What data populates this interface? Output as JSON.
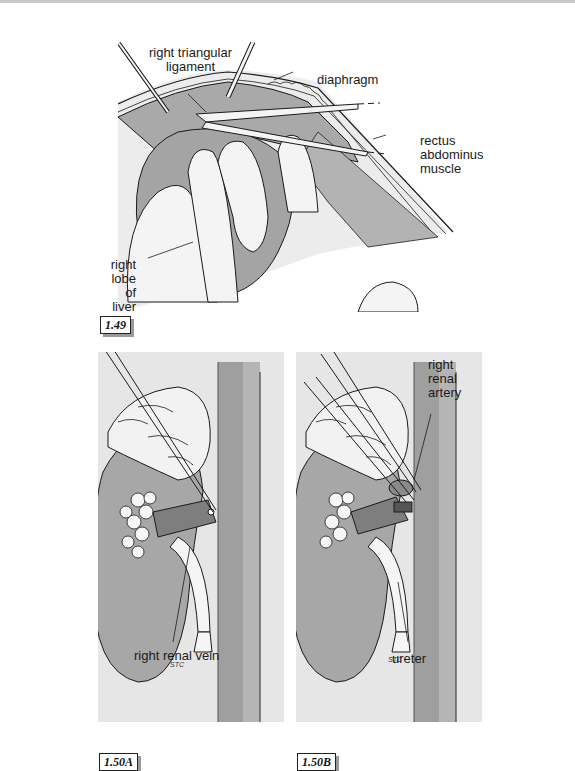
{
  "figures": [
    {
      "id": "fig-1-49",
      "tag": "1.49",
      "labels": {
        "right_triangular_ligament": [
          "right triangular",
          "ligament"
        ],
        "diaphragm": "diaphragm",
        "rectus_abdominus_muscle": [
          "rectus",
          "abdominus",
          "muscle"
        ],
        "right_lobe_of_liver": [
          "right",
          "lobe",
          "of",
          "liver"
        ],
        "signature": "STC"
      }
    },
    {
      "id": "fig-1-50a",
      "tag": "1.50A",
      "labels": {
        "right_renal_vein": "right renal vein",
        "signature": "STC"
      }
    },
    {
      "id": "fig-1-50b",
      "tag": "1.50B",
      "labels": {
        "right_renal_artery": [
          "right",
          "renal",
          "artery"
        ],
        "ureter": "ureter",
        "signature": "STC"
      }
    }
  ],
  "colors": {
    "panel_bg": "#e6e6e6",
    "organ_gray": "#aaaaaa",
    "vessel_gray": "#9d9d9d",
    "line": "#1a1a1a",
    "tag_shadow": "#9a9a9a"
  }
}
